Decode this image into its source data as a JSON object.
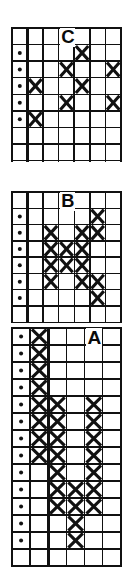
{
  "figure": {
    "title": "",
    "background_color": "#ffffff",
    "ink_color": "#111111",
    "panel_count": 3
  },
  "chart_data": {
    "type": "heatmap",
    "title": "",
    "subtitle": "",
    "xlabel": "",
    "ylabel": "",
    "grid": true,
    "legend_position": "none",
    "marker_names": [
      "x-mark",
      "dot-mark"
    ],
    "panels": [
      {
        "label": "C",
        "label_col": 3,
        "label_row": 0,
        "cols": 7,
        "rows": 8,
        "heavy_cols": [
          0,
          1,
          4,
          7
        ],
        "heavy_rows": [
          0,
          7
        ],
        "dot_cells": [
          {
            "col": 0,
            "row": 1
          },
          {
            "col": 0,
            "row": 2
          },
          {
            "col": 0,
            "row": 3
          },
          {
            "col": 0,
            "row": 4
          },
          {
            "col": 0,
            "row": 5
          }
        ],
        "x_cells": [
          {
            "col": 4,
            "row": 1
          },
          {
            "col": 3,
            "row": 2
          },
          {
            "col": 6,
            "row": 2
          },
          {
            "col": 1,
            "row": 3
          },
          {
            "col": 4,
            "row": 3
          },
          {
            "col": 3,
            "row": 4
          },
          {
            "col": 6,
            "row": 4
          },
          {
            "col": 1,
            "row": 5
          }
        ]
      },
      {
        "label": "B",
        "label_col": 3,
        "label_row": 0,
        "cols": 7,
        "rows": 8,
        "heavy_cols": [
          0,
          1,
          5,
          7
        ],
        "heavy_rows": [
          0,
          7
        ],
        "dot_cells": [
          {
            "col": 0,
            "row": 1
          },
          {
            "col": 0,
            "row": 2
          },
          {
            "col": 0,
            "row": 3
          },
          {
            "col": 0,
            "row": 4
          },
          {
            "col": 0,
            "row": 5
          },
          {
            "col": 0,
            "row": 6
          }
        ],
        "x_cells": [
          {
            "col": 5,
            "row": 1
          },
          {
            "col": 2,
            "row": 2
          },
          {
            "col": 4,
            "row": 2
          },
          {
            "col": 5,
            "row": 2
          },
          {
            "col": 2,
            "row": 3
          },
          {
            "col": 3,
            "row": 3
          },
          {
            "col": 4,
            "row": 3
          },
          {
            "col": 2,
            "row": 4
          },
          {
            "col": 3,
            "row": 4
          },
          {
            "col": 4,
            "row": 4
          },
          {
            "col": 2,
            "row": 5
          },
          {
            "col": 4,
            "row": 5
          },
          {
            "col": 5,
            "row": 5
          },
          {
            "col": 5,
            "row": 6
          }
        ]
      },
      {
        "label": "A",
        "label_col": 4,
        "label_row": 0,
        "cols": 6,
        "rows": 14,
        "heavy_cols": [
          0,
          1,
          2,
          6
        ],
        "heavy_rows": [
          0,
          13
        ],
        "dot_cells": [
          {
            "col": 0,
            "row": 0
          },
          {
            "col": 0,
            "row": 1
          },
          {
            "col": 0,
            "row": 2
          },
          {
            "col": 0,
            "row": 3
          },
          {
            "col": 0,
            "row": 4
          },
          {
            "col": 0,
            "row": 5
          },
          {
            "col": 0,
            "row": 6
          },
          {
            "col": 0,
            "row": 7
          },
          {
            "col": 0,
            "row": 8
          },
          {
            "col": 0,
            "row": 9
          },
          {
            "col": 0,
            "row": 10
          },
          {
            "col": 0,
            "row": 11
          },
          {
            "col": 0,
            "row": 12
          }
        ],
        "x_cells": [
          {
            "col": 1,
            "row": 0
          },
          {
            "col": 1,
            "row": 1
          },
          {
            "col": 1,
            "row": 2
          },
          {
            "col": 1,
            "row": 3
          },
          {
            "col": 1,
            "row": 4
          },
          {
            "col": 1,
            "row": 5
          },
          {
            "col": 1,
            "row": 6
          },
          {
            "col": 1,
            "row": 7
          },
          {
            "col": 2,
            "row": 4
          },
          {
            "col": 2,
            "row": 5
          },
          {
            "col": 2,
            "row": 6
          },
          {
            "col": 2,
            "row": 7
          },
          {
            "col": 2,
            "row": 8
          },
          {
            "col": 2,
            "row": 9
          },
          {
            "col": 2,
            "row": 10
          },
          {
            "col": 4,
            "row": 4
          },
          {
            "col": 4,
            "row": 5
          },
          {
            "col": 4,
            "row": 6
          },
          {
            "col": 4,
            "row": 7
          },
          {
            "col": 4,
            "row": 8
          },
          {
            "col": 3,
            "row": 9
          },
          {
            "col": 4,
            "row": 9
          },
          {
            "col": 3,
            "row": 10
          },
          {
            "col": 4,
            "row": 10
          },
          {
            "col": 3,
            "row": 11
          },
          {
            "col": 3,
            "row": 12
          }
        ]
      }
    ]
  }
}
